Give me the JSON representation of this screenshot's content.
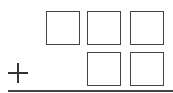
{
  "problem": {
    "operator": "+",
    "top_row": {
      "digit_boxes": 3,
      "values": [
        "",
        "",
        ""
      ]
    },
    "bottom_row": {
      "digit_boxes": 2,
      "values": [
        "",
        ""
      ]
    }
  }
}
